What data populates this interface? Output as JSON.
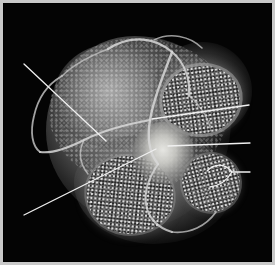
{
  "figure": {
    "kind": "grayscale-3d-volume-rendering",
    "modality_appearance": "monochrome 3D volume-rendered anatomical specimen on black background",
    "background_color": "#000000",
    "frame_color": "#c9c9c9",
    "label_color": "#f2f2f2",
    "width_px": 275,
    "height_px": 265
  },
  "annotations": [
    {
      "id": "callout-1",
      "label": "1",
      "label_x": 254,
      "label_y": 136,
      "leader": {
        "type": "straight",
        "from_x": 250,
        "from_y": 143,
        "to_x": 168,
        "to_y": 146
      }
    },
    {
      "id": "callout-2",
      "label": "2",
      "label_x": 254,
      "label_y": 164,
      "leader": {
        "type": "forked-bracket",
        "from_x": 250,
        "from_y": 172,
        "branch_a_x": 207,
        "branch_a_y": 171,
        "branch_b_x": 210,
        "branch_b_y": 187
      }
    },
    {
      "id": "callout-3",
      "label": "3",
      "label_x": 253,
      "label_y": 98,
      "leader": {
        "type": "straight",
        "from_x": 249,
        "from_y": 105,
        "to_x": 152,
        "to_y": 119
      }
    },
    {
      "id": "callout-4",
      "label": "4",
      "label_x": 12,
      "label_y": 55,
      "leader": {
        "type": "straight",
        "from_x": 24,
        "from_y": 64,
        "to_x": 106,
        "to_y": 141
      }
    },
    {
      "id": "callout-5",
      "label": "5",
      "label_x": 11,
      "label_y": 207,
      "leader": {
        "type": "straight",
        "from_x": 24,
        "from_y": 215,
        "to_x": 156,
        "to_y": 149
      }
    }
  ]
}
